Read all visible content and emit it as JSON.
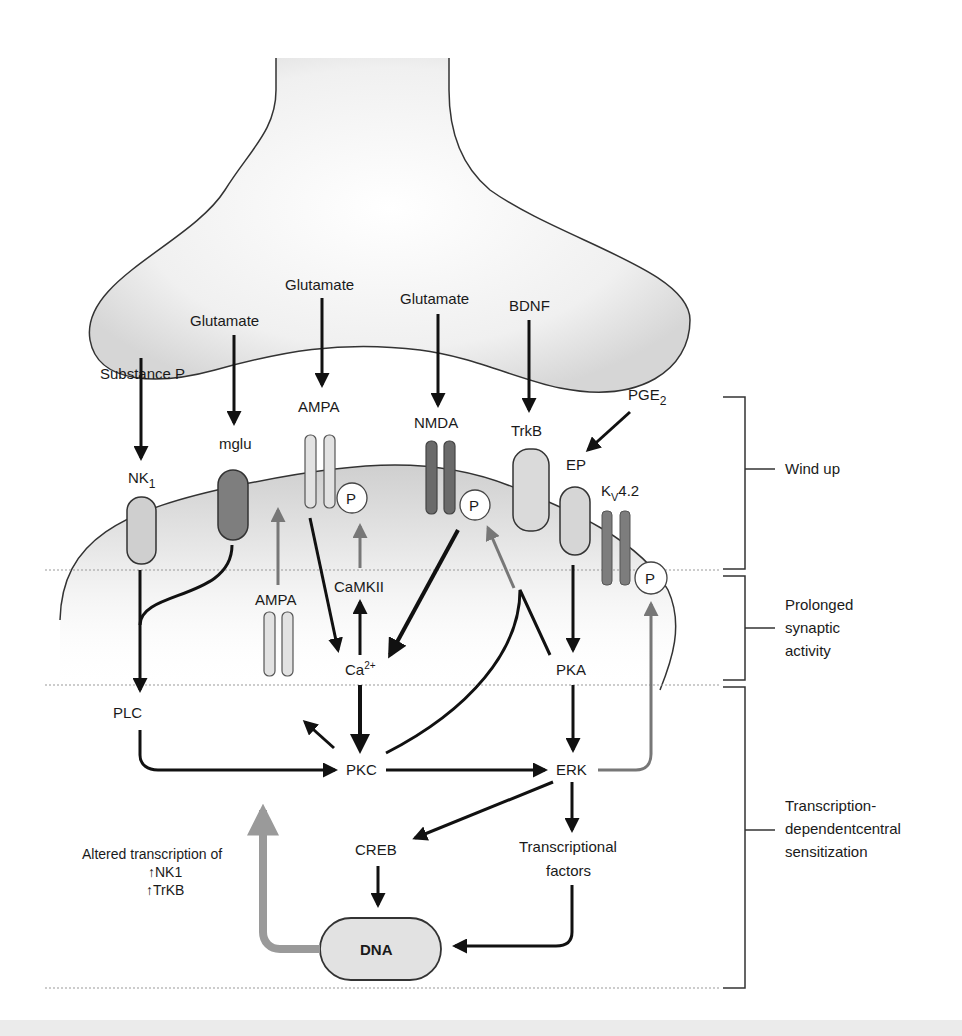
{
  "figure": {
    "presynaptic_ligands": [
      {
        "id": "substance-p",
        "label": "Substance P"
      },
      {
        "id": "glutamate-mglu",
        "label": "Glutamate"
      },
      {
        "id": "glutamate-ampa",
        "label": "Glutamate"
      },
      {
        "id": "glutamate-nmda",
        "label": "Glutamate"
      },
      {
        "id": "bdnf",
        "label": "BDNF"
      },
      {
        "id": "pge2",
        "label": "PGE",
        "sub": "2"
      }
    ],
    "receptors": {
      "nk1": {
        "label": "NK",
        "sub": "1"
      },
      "mglu": {
        "label": "mglu"
      },
      "ampa_membrane": {
        "label": "AMPA"
      },
      "nmda": {
        "label": "NMDA"
      },
      "trkb": {
        "label": "TrkB"
      },
      "ep": {
        "label": "EP"
      },
      "kv42": {
        "label": "K",
        "sub": "V",
        "suffix": "4.2"
      },
      "ampa_internal": {
        "label": "AMPA"
      }
    },
    "phospho_label": "P",
    "nodes": {
      "camkii": "CaMKII",
      "ca": "Ca",
      "ca_sup": "2+",
      "pka": "PKA",
      "plc": "PLC",
      "pkc": "PKC",
      "erk": "ERK",
      "creb": "CREB",
      "tf_line1": "Transcriptional",
      "tf_line2": "factors",
      "dna": "DNA"
    },
    "altered_transcription": {
      "line1": "Altered transcription of",
      "line2": "↑NK1",
      "line3": "↑TrKB"
    },
    "phases": [
      {
        "id": "wind-up",
        "lines": [
          "Wind up"
        ]
      },
      {
        "id": "prolonged",
        "lines": [
          "Prolonged",
          "synaptic",
          "activity"
        ]
      },
      {
        "id": "transcription",
        "lines": [
          "Transcription-",
          "dependentcentral",
          "sensitization"
        ]
      }
    ],
    "colors": {
      "black_arrow": "#111111",
      "gray_arrow": "#777777",
      "light_receptor": "#dcdcdc",
      "dark_receptor": "#7a7a7a",
      "terminal_fill": "#e6e6e6"
    }
  }
}
